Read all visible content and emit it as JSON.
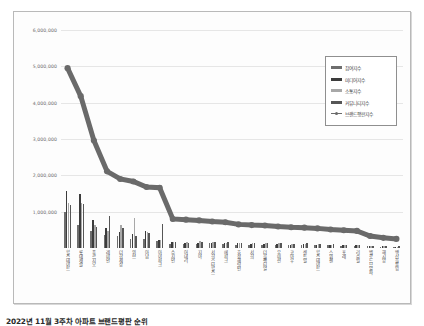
{
  "caption": "2022년 11월 3주차 아파트 브랜드평판 순위",
  "legend": {
    "position": "top-right",
    "items": [
      {
        "label": "참여지수",
        "color": "#6e6e6e",
        "type": "bar"
      },
      {
        "label": "미디어지수",
        "color": "#3c3c3c",
        "type": "bar"
      },
      {
        "label": "소통지수",
        "color": "#a8a8a8",
        "type": "bar"
      },
      {
        "label": "커뮤니티지수",
        "color": "#565656",
        "type": "bar"
      },
      {
        "label": "브랜드평판지수",
        "color": "#6a6a6a",
        "type": "line"
      }
    ]
  },
  "chart_data": {
    "type": "bar",
    "title": "",
    "xlabel": "",
    "ylabel": "",
    "ylim": [
      0,
      6000000
    ],
    "ytick_labels": [
      "6,000,000",
      "5,000,000",
      "4,000,000",
      "3,000,000",
      "2,000,000",
      "1,000,000"
    ],
    "yticks": [
      6000000,
      5000000,
      4000000,
      3000000,
      2000000,
      1000000
    ],
    "grid": true,
    "categories": [
      "힐스테이트",
      "롯데캐슬",
      "푸르지오",
      "레미안",
      "더한세상",
      "위브",
      "아남",
      "아이파크",
      "수지인",
      "어데리",
      "지아",
      "서희스타힐스",
      "에피크",
      "효성해링턴",
      "서희",
      "더블랜티얼",
      "우미린",
      "코아우",
      "센트럴",
      "힐스테이트",
      "스위첸",
      "포레",
      "리슈빌",
      "벨로드므알파",
      "해시앙",
      "백산블루밍"
    ],
    "series": [
      {
        "name": "참여지수",
        "values": [
          980000,
          640000,
          470000,
          360000,
          330000,
          250000,
          250000,
          195000,
          120000,
          120000,
          105000,
          130000,
          105000,
          90000,
          85000,
          80000,
          80000,
          75000,
          85000,
          75000,
          70000,
          60000,
          60000,
          42000,
          36000,
          30000
        ]
      },
      {
        "name": "미디어지수",
        "values": [
          1560000,
          1500000,
          780000,
          560000,
          430000,
          390000,
          480000,
          230000,
          160000,
          150000,
          140000,
          150000,
          130000,
          130000,
          115000,
          115000,
          110000,
          95000,
          105000,
          95000,
          85000,
          78000,
          72000,
          50000,
          42000,
          36000
        ]
      },
      {
        "name": "소통지수",
        "values": [
          1230000,
          1230000,
          620000,
          480000,
          620000,
          820000,
          440000,
          230000,
          155000,
          170000,
          200000,
          175000,
          145000,
          150000,
          130000,
          125000,
          125000,
          110000,
          115000,
          100000,
          92000,
          84000,
          78000,
          55000,
          45000,
          40000
        ]
      },
      {
        "name": "커뮤니티지수",
        "values": [
          1180000,
          1210000,
          580000,
          890000,
          560000,
          340000,
          420000,
          660000,
          165000,
          150000,
          165000,
          160000,
          175000,
          145000,
          140000,
          140000,
          130000,
          120000,
          125000,
          110000,
          98000,
          90000,
          85000,
          58000,
          48000,
          44000
        ]
      }
    ],
    "line_series": {
      "name": "브랜드평판지수",
      "values": [
        4950000,
        4180000,
        2960000,
        2110000,
        1900000,
        1830000,
        1680000,
        1660000,
        800000,
        780000,
        760000,
        730000,
        710000,
        650000,
        630000,
        620000,
        590000,
        570000,
        560000,
        540000,
        510000,
        490000,
        470000,
        330000,
        280000,
        250000
      ]
    }
  }
}
